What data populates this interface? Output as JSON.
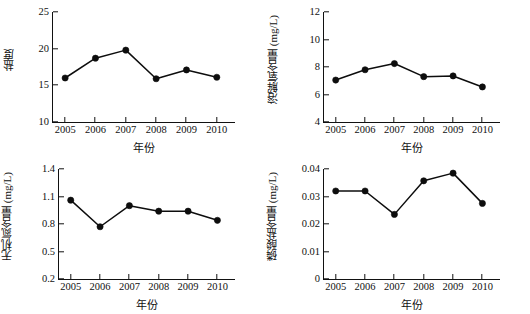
{
  "figure": {
    "layout": "2x2 grid of line charts",
    "background": "#ffffff",
    "line_color": "#0d0d0d",
    "marker_color": "#0d0d0d"
  },
  "chart_data": [
    {
      "type": "line",
      "title": "",
      "xlabel": "年份",
      "ylabel": "盐度",
      "categories": [
        "2005",
        "2006",
        "2007",
        "2008",
        "2009",
        "2010"
      ],
      "x": [
        2005,
        2006,
        2007,
        2008,
        2009,
        2010
      ],
      "values": [
        16.0,
        18.7,
        19.8,
        15.9,
        17.1,
        16.1
      ],
      "ylim": [
        10,
        25
      ],
      "yticks": [
        10,
        15,
        20,
        25
      ],
      "ytick_labels": [
        "10",
        "15",
        "20",
        "25"
      ],
      "xlim": [
        2004.6,
        2010.6
      ],
      "grid": false,
      "legend": "none",
      "marker": "filled-circle"
    },
    {
      "type": "line",
      "title": "",
      "xlabel": "年份",
      "ylabel": "溶解氧含量 (mg/L)",
      "categories": [
        "2005",
        "2006",
        "2007",
        "2008",
        "2009",
        "2010"
      ],
      "x": [
        2005,
        2006,
        2007,
        2008,
        2009,
        2010
      ],
      "values": [
        7.05,
        7.8,
        8.25,
        7.3,
        7.35,
        6.55
      ],
      "ylim": [
        4,
        12
      ],
      "yticks": [
        4,
        6,
        8,
        10,
        12
      ],
      "ytick_labels": [
        "4",
        "6",
        "8",
        "10",
        "12"
      ],
      "xlim": [
        2004.6,
        2010.6
      ],
      "grid": false,
      "legend": "none",
      "marker": "filled-circle"
    },
    {
      "type": "line",
      "title": "",
      "xlabel": "年份",
      "ylabel": "无机氮含量 (mg/L)",
      "categories": [
        "2005",
        "2006",
        "2007",
        "2008",
        "2009",
        "2010"
      ],
      "x": [
        2005,
        2006,
        2007,
        2008,
        2009,
        2010
      ],
      "values": [
        1.06,
        0.77,
        1.0,
        0.94,
        0.94,
        0.84
      ],
      "ylim": [
        0.2,
        1.4
      ],
      "yticks": [
        0.2,
        0.5,
        0.8,
        1.1,
        1.4
      ],
      "ytick_labels": [
        "0.2",
        "0.5",
        "0.8",
        "1.1",
        "1.4"
      ],
      "xlim": [
        2004.6,
        2010.6
      ],
      "grid": false,
      "legend": "none",
      "marker": "filled-circle"
    },
    {
      "type": "line",
      "title": "",
      "xlabel": "年份",
      "ylabel": "磷酸盐含量 (mg/L)",
      "categories": [
        "2005",
        "2006",
        "2007",
        "2008",
        "2009",
        "2010"
      ],
      "x": [
        2005,
        2006,
        2007,
        2008,
        2009,
        2010
      ],
      "values": [
        0.032,
        0.032,
        0.0235,
        0.0357,
        0.0385,
        0.0275
      ],
      "ylim": [
        0,
        0.04
      ],
      "yticks": [
        0,
        0.01,
        0.02,
        0.03,
        0.04
      ],
      "ytick_labels": [
        "0",
        "0.01",
        "0.02",
        "0.03",
        "0.04"
      ],
      "xlim": [
        2004.6,
        2010.6
      ],
      "grid": false,
      "legend": "none",
      "marker": "filled-circle"
    }
  ]
}
